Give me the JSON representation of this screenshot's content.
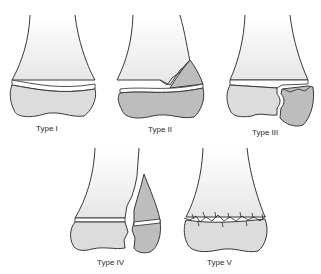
{
  "figure": {
    "panels": [
      {
        "id": "type-1",
        "label": "Type I"
      },
      {
        "id": "type-2",
        "label": "Type II"
      },
      {
        "id": "type-3",
        "label": "Type III"
      },
      {
        "id": "type-4",
        "label": "Type IV"
      },
      {
        "id": "type-5",
        "label": "Type V"
      }
    ]
  },
  "colors": {
    "bone_fill": "#e9e9e9",
    "fragment_fill": "#bdbdbd",
    "physis_fill": "#ffffff",
    "outline": "#3a3a3a",
    "background": "#ffffff"
  }
}
